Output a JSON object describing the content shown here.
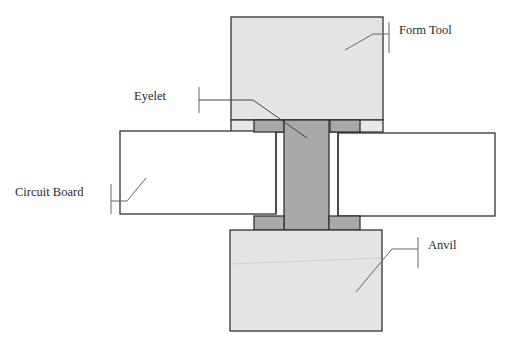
{
  "diagram": {
    "labels": {
      "form_tool": "Form Tool",
      "eyelet": "Eyelet",
      "circuit_board": "Circuit Board",
      "anvil": "Anvil"
    },
    "colors": {
      "tool": "#e4e4e4",
      "eyelet": "#a9a9a9",
      "board": "#ffffff",
      "outline": "#333333",
      "leader": "#666666",
      "text": "#2a2a2a"
    }
  }
}
